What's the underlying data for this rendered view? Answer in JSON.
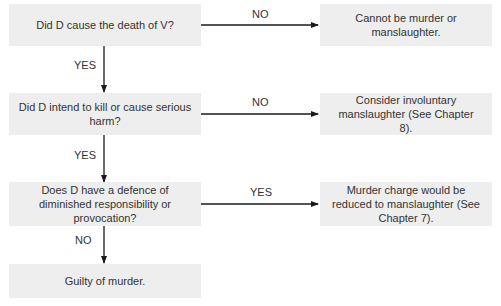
{
  "diagram": {
    "type": "flowchart",
    "colors": {
      "box_fill": "#eeeeee",
      "text": "#333333",
      "arrow": "#1a1a1a"
    },
    "questions": [
      {
        "id": "q1",
        "text": "Did D cause the death of V?"
      },
      {
        "id": "q2",
        "text": "Did D intend to kill or cause serious harm?"
      },
      {
        "id": "q3",
        "text": "Does D have a defence of diminished responsibility or provocation?"
      }
    ],
    "outcomes": [
      {
        "id": "o1",
        "text": "Cannot be murder or manslaughter."
      },
      {
        "id": "o2",
        "text": "Consider involuntary manslaughter (See Chapter 8)."
      },
      {
        "id": "o3",
        "text": "Murder charge would be reduced to manslaughter (See Chapter 7)."
      },
      {
        "id": "o4",
        "text": "Guilty of murder."
      }
    ],
    "edges": [
      {
        "from": "q1",
        "to": "o1",
        "label": "NO"
      },
      {
        "from": "q1",
        "to": "q2",
        "label": "YES"
      },
      {
        "from": "q2",
        "to": "o2",
        "label": "NO"
      },
      {
        "from": "q2",
        "to": "q3",
        "label": "YES"
      },
      {
        "from": "q3",
        "to": "o3",
        "label": "YES"
      },
      {
        "from": "q3",
        "to": "o4",
        "label": "NO"
      }
    ]
  }
}
